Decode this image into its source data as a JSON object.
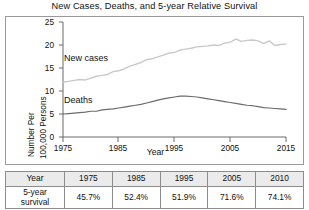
{
  "chart_title": "New Cases, Deaths, and 5-year Relative Survival",
  "axes": {
    "ylabel_line1": "Number Per",
    "ylabel_line2": "100,000 Persons",
    "xlabel": "Year",
    "yticks": [
      "0",
      "5",
      "10",
      "15",
      "20",
      "25"
    ],
    "xticks": [
      "1975",
      "1985",
      "1995",
      "2005",
      "2015"
    ]
  },
  "series_labels": {
    "new_cases": "New cases",
    "deaths": "Deaths"
  },
  "colors": {
    "new_cases_line": "#c9c9c9",
    "deaths_line": "#6b6b6b",
    "frame": "#9a9a9a",
    "table_border": "#8c8c8c",
    "table_header_bg": "#ebebeb",
    "text": "#111111"
  },
  "table": {
    "header": [
      "Year",
      "1975",
      "1985",
      "1995",
      "2005",
      "2010"
    ],
    "row_label_line1": "5-year",
    "row_label_line2": "survival",
    "values": [
      "45.7%",
      "52.4%",
      "51.9%",
      "71.6%",
      "74.1%"
    ]
  },
  "chart_data": {
    "type": "line",
    "title": "New Cases, Deaths, and 5-year Relative Survival",
    "xlabel": "Year",
    "ylabel": "Number Per 100,000 Persons",
    "xlim": [
      1975,
      2015
    ],
    "ylim": [
      0,
      25
    ],
    "yticks": [
      0,
      5,
      10,
      15,
      20,
      25
    ],
    "xticks": [
      1975,
      1985,
      1995,
      2005,
      2015
    ],
    "grid": false,
    "legend": "inline-labels",
    "x": [
      1975,
      1976,
      1977,
      1978,
      1979,
      1980,
      1981,
      1982,
      1983,
      1984,
      1985,
      1986,
      1987,
      1988,
      1989,
      1990,
      1991,
      1992,
      1993,
      1994,
      1995,
      1996,
      1997,
      1998,
      1999,
      2000,
      2001,
      2002,
      2003,
      2004,
      2005,
      2006,
      2007,
      2008,
      2009,
      2010,
      2011,
      2012,
      2013,
      2014,
      2015
    ],
    "series": [
      {
        "name": "New cases",
        "color": "#c9c9c9",
        "values": [
          11.9,
          12.1,
          12.3,
          12.5,
          12.4,
          12.8,
          13.2,
          13.4,
          13.6,
          14.2,
          14.4,
          14.8,
          15.4,
          15.8,
          16.2,
          16.8,
          17.0,
          17.4,
          17.8,
          18.2,
          18.4,
          18.9,
          19.1,
          19.3,
          19.6,
          19.7,
          19.8,
          20.0,
          19.9,
          20.4,
          20.6,
          21.3,
          20.8,
          21.0,
          21.1,
          20.9,
          20.3,
          20.9,
          19.9,
          20.1,
          20.2
        ]
      },
      {
        "name": "Deaths",
        "color": "#6b6b6b",
        "values": [
          5.0,
          5.1,
          5.2,
          5.3,
          5.4,
          5.6,
          5.6,
          5.9,
          6.0,
          6.1,
          6.3,
          6.5,
          6.7,
          6.9,
          7.1,
          7.4,
          7.7,
          8.0,
          8.3,
          8.5,
          8.7,
          8.9,
          8.9,
          8.8,
          8.7,
          8.5,
          8.3,
          8.1,
          7.9,
          7.7,
          7.5,
          7.3,
          7.1,
          6.9,
          6.8,
          6.6,
          6.4,
          6.3,
          6.2,
          6.1,
          6.0
        ]
      }
    ],
    "annotations": [
      {
        "text": "New cases",
        "x": 1979,
        "y": 16.5
      },
      {
        "text": "Deaths",
        "x": 1979,
        "y": 8.0
      }
    ]
  },
  "table_data": {
    "type": "table",
    "columns": [
      "Year",
      "1975",
      "1985",
      "1995",
      "2005",
      "2010"
    ],
    "rows": [
      {
        "label": "5-year survival",
        "values": [
          "45.7%",
          "52.4%",
          "51.9%",
          "71.6%",
          "74.1%"
        ]
      }
    ]
  }
}
